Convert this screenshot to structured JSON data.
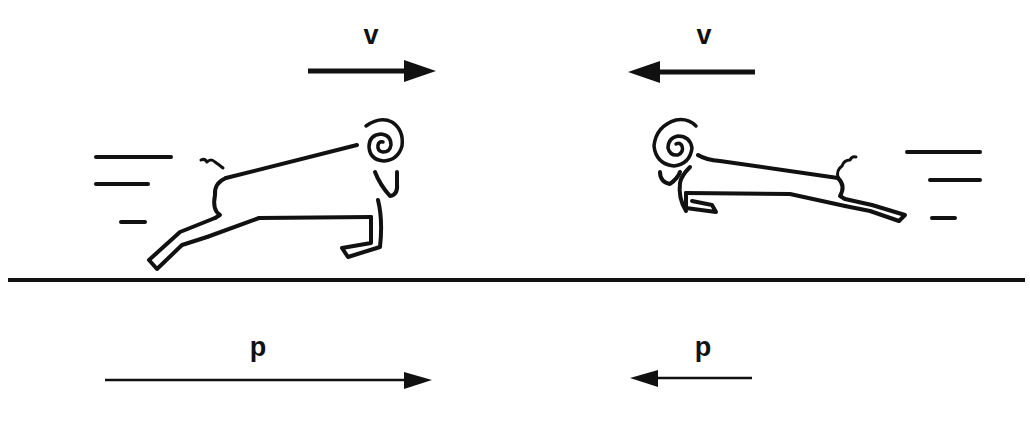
{
  "diagram": {
    "type": "physics-momentum-collision",
    "colors": {
      "ink": "#111111",
      "background": "#ffffff"
    },
    "velocity_labels": {
      "left": "v",
      "right": "v"
    },
    "momentum_labels": {
      "left": "p",
      "right": "p"
    },
    "arrows": [
      {
        "name": "velocity-left",
        "direction": "right",
        "label": "v",
        "x1": 308,
        "x2": 435,
        "y": 71,
        "weight": "thick"
      },
      {
        "name": "velocity-right",
        "direction": "left",
        "label": "v",
        "x1": 755,
        "x2": 628,
        "y": 72,
        "weight": "thick"
      },
      {
        "name": "momentum-left",
        "direction": "right",
        "label": "p",
        "x1": 105,
        "x2": 432,
        "y": 380,
        "weight": "thin",
        "relative_length": "long"
      },
      {
        "name": "momentum-right",
        "direction": "left",
        "label": "p",
        "x1": 752,
        "x2": 630,
        "y": 378,
        "weight": "thin",
        "relative_length": "short"
      }
    ],
    "objects": [
      {
        "name": "ram-left",
        "facing": "right",
        "description": "large ram charging right"
      },
      {
        "name": "ram-right",
        "facing": "left",
        "description": "smaller ram charging left"
      }
    ],
    "ground_line": {
      "y": 280,
      "x1": 8,
      "x2": 1025
    }
  }
}
